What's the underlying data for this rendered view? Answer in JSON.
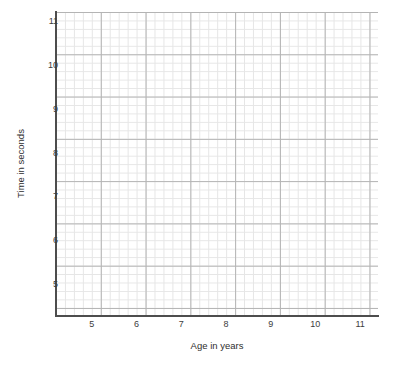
{
  "chart_data": {
    "type": "scatter",
    "title": "",
    "xlabel": "Age in years",
    "ylabel": "Time in seconds",
    "xlim": [
      4.2,
      11.4
    ],
    "ylim": [
      4.3,
      11.2
    ],
    "xticks": [
      "5",
      "6",
      "7",
      "8",
      "9",
      "10",
      "11"
    ],
    "xtick_values": [
      5,
      6,
      7,
      8,
      9,
      10,
      11
    ],
    "yticks": [
      "11",
      "10",
      "9",
      "8",
      "7",
      "6",
      "5"
    ],
    "ytick_values": [
      11,
      10,
      9,
      8,
      7,
      6,
      5
    ],
    "series": [
      {
        "name": "data",
        "x": [],
        "y": []
      }
    ],
    "grid": true,
    "grid_minor": true,
    "minor_per_major": 5,
    "legend": null,
    "annotations": [],
    "colors": {
      "grid_minor": "#e6e6e6",
      "grid_major": "#b4b4b4",
      "axis": "#4d4d4d",
      "text": "#3c3c3c",
      "background": "#ffffff"
    }
  },
  "axes": {
    "x": {
      "title": "Age in years",
      "ticks": [
        {
          "label": "5",
          "value": 5
        },
        {
          "label": "6",
          "value": 6
        },
        {
          "label": "7",
          "value": 7
        },
        {
          "label": "8",
          "value": 8
        },
        {
          "label": "9",
          "value": 9
        },
        {
          "label": "10",
          "value": 10
        },
        {
          "label": "11",
          "value": 11
        }
      ]
    },
    "y": {
      "title": "Time in seconds",
      "ticks": [
        {
          "label": "11",
          "value": 11
        },
        {
          "label": "10",
          "value": 10
        },
        {
          "label": "9",
          "value": 9
        },
        {
          "label": "8",
          "value": 8
        },
        {
          "label": "7",
          "value": 7
        },
        {
          "label": "6",
          "value": 6
        },
        {
          "label": "5",
          "value": 5
        }
      ]
    }
  }
}
